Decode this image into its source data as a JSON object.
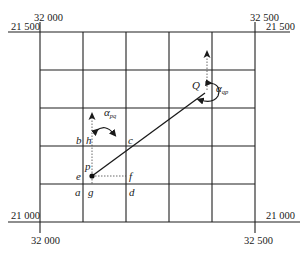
{
  "diagram": {
    "type": "grid-bearing-diagram",
    "coordinates": {
      "top_left_easting": "32 000",
      "top_left_northing": "21 500",
      "top_right_easting": "32 500",
      "top_right_northing": "21 500",
      "bottom_left_easting": "32 000",
      "bottom_left_northing": "21 000",
      "bottom_right_easting": "32 500",
      "bottom_right_northing": "21 000"
    },
    "points": {
      "Q": "Q",
      "p": "p",
      "a": "a",
      "b": "b",
      "c": "c",
      "d": "d",
      "e": "e",
      "f": "f",
      "g": "g",
      "h": "h"
    },
    "angles": {
      "pq_symbol": "α",
      "pq_sub": "pq",
      "qp_symbol": "α",
      "qp_sub": "qp"
    },
    "grid": {
      "columns": 5,
      "rows": 5
    },
    "colors": {
      "line": "#1f1f1f",
      "background": "#ffffff"
    }
  }
}
